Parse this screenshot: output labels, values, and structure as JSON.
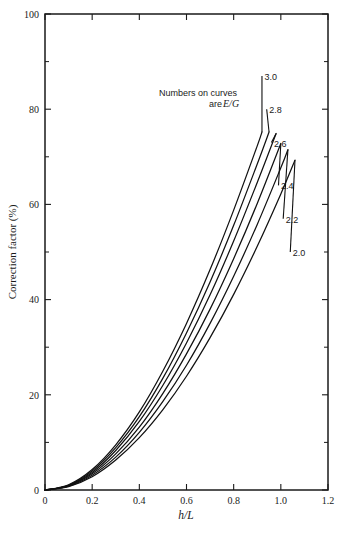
{
  "figure": {
    "caption": "",
    "background_color": "#ffffff",
    "ink_color": "#111111"
  },
  "chart_data": {
    "type": "line",
    "title": "",
    "subtitle": "",
    "xlabel": "h/L",
    "ylabel": "Correction factor (%)",
    "xlim": [
      0,
      1.2
    ],
    "ylim": [
      0,
      100
    ],
    "grid": false,
    "legend_position": "inline-curve-labels",
    "annotations": [
      {
        "id": "curve-note",
        "line1": "Numbers on curves",
        "line2_prefix": "are ",
        "line2_italic": "E/G"
      }
    ],
    "x_ticks": [
      0,
      0.2,
      0.4,
      0.6,
      0.8,
      1.0,
      1.2
    ],
    "x_tick_labels": [
      "0",
      "0.2",
      "0.4",
      "0.6",
      "0.8",
      "1.0",
      "1.2"
    ],
    "y_ticks": [
      0,
      20,
      40,
      60,
      80,
      100
    ],
    "y_tick_labels": [
      "0",
      "20",
      "40",
      "60",
      "80",
      "100"
    ],
    "y_minor_ticks": [
      10,
      30,
      50,
      70,
      90
    ],
    "series": [
      {
        "name": "3.0",
        "label": "3.0",
        "x": [
          0,
          0.1,
          0.2,
          0.3,
          0.4,
          0.5,
          0.6,
          0.7,
          0.8,
          0.9,
          0.92
        ],
        "values": [
          0,
          1.1,
          4.3,
          9.5,
          16.4,
          25.0,
          35.0,
          46.3,
          58.8,
          72.3,
          75.2
        ]
      },
      {
        "name": "2.8",
        "label": "2.8",
        "x": [
          0,
          0.1,
          0.2,
          0.3,
          0.4,
          0.5,
          0.6,
          0.7,
          0.8,
          0.9,
          0.95
        ],
        "values": [
          0,
          1.0,
          4.0,
          8.9,
          15.4,
          23.5,
          33.0,
          43.7,
          55.6,
          68.5,
          75.2
        ]
      },
      {
        "name": "2.6",
        "label": "2.6",
        "x": [
          0,
          0.1,
          0.2,
          0.3,
          0.4,
          0.5,
          0.6,
          0.7,
          0.8,
          0.9,
          0.98
        ],
        "values": [
          0,
          0.95,
          3.7,
          8.3,
          14.4,
          22.0,
          30.9,
          41.0,
          52.3,
          64.6,
          74.9
        ]
      },
      {
        "name": "2.4",
        "label": "2.4",
        "x": [
          0,
          0.1,
          0.2,
          0.3,
          0.4,
          0.5,
          0.6,
          0.7,
          0.8,
          0.9,
          1.0
        ],
        "values": [
          0,
          0.87,
          3.4,
          7.6,
          13.2,
          20.3,
          28.6,
          38.0,
          48.6,
          60.2,
          72.8
        ]
      },
      {
        "name": "2.2",
        "label": "2.2",
        "x": [
          0,
          0.1,
          0.2,
          0.3,
          0.4,
          0.5,
          0.6,
          0.7,
          0.8,
          0.9,
          1.0,
          1.03
        ],
        "values": [
          0,
          0.79,
          3.1,
          6.9,
          12.1,
          18.6,
          26.2,
          35.0,
          44.9,
          55.8,
          67.7,
          71.5
        ]
      },
      {
        "name": "2.0",
        "label": "2.0",
        "x": [
          0,
          0.1,
          0.2,
          0.3,
          0.4,
          0.5,
          0.6,
          0.7,
          0.8,
          0.9,
          1.0,
          1.06
        ],
        "values": [
          0,
          0.71,
          2.8,
          6.3,
          11.0,
          16.9,
          23.9,
          32.0,
          41.1,
          51.2,
          62.2,
          69.3
        ]
      }
    ],
    "curve_end_labels": [
      {
        "label": "3.0",
        "x": 0.92,
        "y": 87
      },
      {
        "label": "2.8",
        "x": 0.94,
        "y": 80
      },
      {
        "label": "2.6",
        "x": 0.96,
        "y": 73
      },
      {
        "label": "2.4",
        "x": 0.99,
        "y": 64
      },
      {
        "label": "2.2",
        "x": 1.01,
        "y": 57
      },
      {
        "label": "2.0",
        "x": 1.04,
        "y": 50
      }
    ]
  }
}
